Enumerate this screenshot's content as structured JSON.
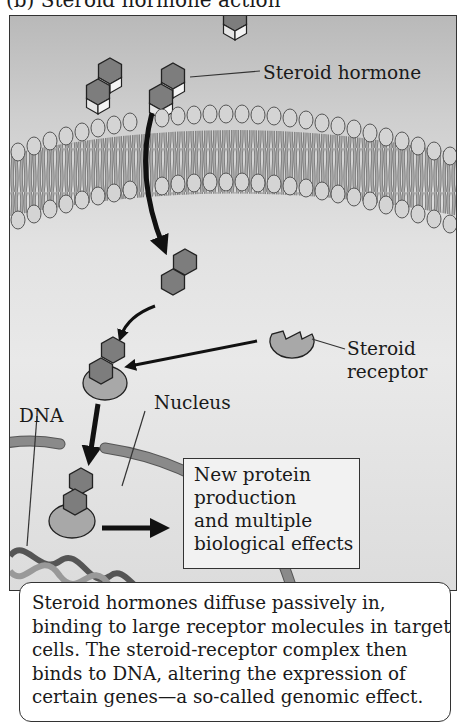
{
  "figure": {
    "title": "(b) Steroid hormone action"
  },
  "labels": {
    "steroid_hormone": "Steroid hormone",
    "steroid_receptor_line1": "Steroid",
    "steroid_receptor_line2": "receptor",
    "nucleus": "Nucleus",
    "dna": "DNA"
  },
  "effects_box": {
    "lines": [
      "New protein",
      "production",
      "and multiple",
      "biological effects"
    ]
  },
  "caption": {
    "lines": [
      "Steroid hormones diffuse passively in,",
      "binding to large receptor molecules in target",
      "cells. The steroid-receptor complex then",
      "binds to DNA, altering the expression of",
      "certain genes—a so-called genomic effect."
    ]
  },
  "colors": {
    "hormone_fill": "#7d7d7d",
    "hormone_face": "#e6e6e6",
    "phospholipid_head": "#d4d4d4",
    "lipid_tail": "#8f8f8f",
    "receptor_fill": "#a8a8a8",
    "nuclear_envelope": "#8a8a8a",
    "arrow": "#111111"
  }
}
